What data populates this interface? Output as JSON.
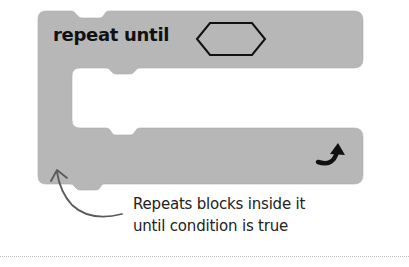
{
  "block": {
    "label": "repeat until",
    "condition_slot": "hexagon-empty",
    "loop_icon": "curved-arrow-icon",
    "color": "#b7b7b7"
  },
  "annotation": {
    "line1": "Repeats blocks inside it",
    "line2": "until condition is true",
    "arrow_color": "#5a5a5a"
  }
}
